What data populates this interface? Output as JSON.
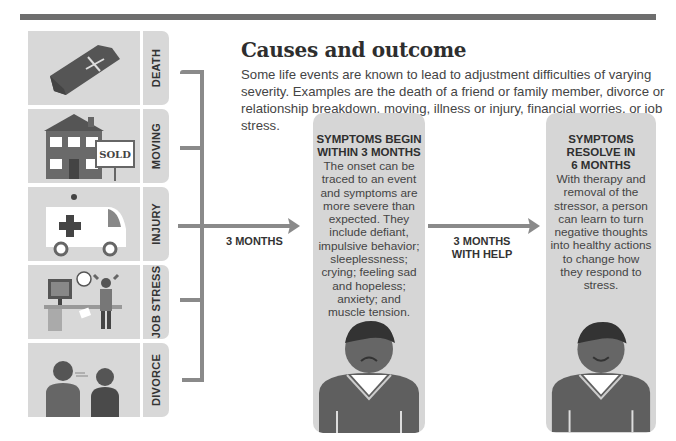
{
  "header": {
    "title": "Causes and outcome"
  },
  "intro": "Some life events are known to lead to adjustment difficulties of varying severity. Examples are the death of a friend or family member, divorce or relationship breakdown, moving, illness or injury, financial worries, or job stress.",
  "causes": [
    {
      "label": "DEATH",
      "icon": "coffin-icon"
    },
    {
      "label": "MOVING",
      "icon": "house-sold-icon",
      "sign_text": "SOLD"
    },
    {
      "label": "INJURY",
      "icon": "ambulance-icon"
    },
    {
      "label": "JOB STRESS",
      "icon": "office-stress-icon"
    },
    {
      "label": "DIVORCE",
      "icon": "arguing-couple-icon"
    }
  ],
  "arrows": [
    {
      "label_line1": "3 MONTHS",
      "label_line2": ""
    },
    {
      "label_line1": "3 MONTHS",
      "label_line2": "WITH HELP"
    }
  ],
  "stages": [
    {
      "heading_line1": "SYMPTOMS BEGIN",
      "heading_line2": "WITHIN 3 MONTHS",
      "heading_line3": "",
      "body": "The onset can be traced to an event and symptoms are more severe than expected. They include defiant, impulsive behavior; sleeplessness; crying; feeling sad and hopeless; anxiety; and muscle tension.",
      "figure": "sad-person-icon"
    },
    {
      "heading_line1": "SYMPTOMS",
      "heading_line2": "RESOLVE IN",
      "heading_line3": "6 MONTHS",
      "body": "With therapy and removal of the stressor, a person can learn to turn negative thoughts into healthy actions to change how they respond to stress.",
      "figure": "happy-person-icon"
    }
  ],
  "colors": {
    "panel": "#d8d8d8",
    "dark": "#5f5f5f",
    "line": "#8a8a8a",
    "bar": "#6e6e6e"
  }
}
